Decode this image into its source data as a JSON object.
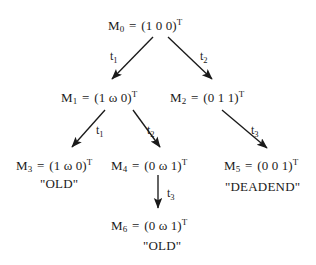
{
  "figure": {
    "type": "reachability-tree",
    "title": "",
    "background_color": "#ffffff",
    "ink_color": "#1a1a1a"
  },
  "nodes": [
    {
      "id": "M0",
      "name": "M",
      "index": "0",
      "equals": "=",
      "vector": "(1 0 0)",
      "transpose": "T",
      "tag": "",
      "x": 108,
      "y": 18
    },
    {
      "id": "M1",
      "name": "M",
      "index": "1",
      "equals": "=",
      "vector": "(1 ω 0)",
      "transpose": "T",
      "tag": "",
      "x": 61,
      "y": 90
    },
    {
      "id": "M2",
      "name": "M",
      "index": "2",
      "equals": "=",
      "vector": "(0 1 1)",
      "transpose": "T",
      "tag": "",
      "x": 170,
      "y": 90
    },
    {
      "id": "M3",
      "name": "M",
      "index": "3",
      "equals": "=",
      "vector": "(1 ω 0)",
      "transpose": "T",
      "tag": "\"OLD\"",
      "x": 16,
      "y": 158
    },
    {
      "id": "M4",
      "name": "M",
      "index": "4",
      "equals": "=",
      "vector": "(0 ω 1)",
      "transpose": "T",
      "tag": "",
      "x": 111,
      "y": 158
    },
    {
      "id": "M5",
      "name": "M",
      "index": "5",
      "equals": "=",
      "vector": "(0 0 1)",
      "transpose": "T",
      "tag": "\"DEADEND\"",
      "x": 224,
      "y": 158
    },
    {
      "id": "M6",
      "name": "M",
      "index": "6",
      "equals": "=",
      "vector": "(0 ω 1)",
      "transpose": "T",
      "tag": "\"OLD\"",
      "x": 111,
      "y": 218
    }
  ],
  "node_tags": [
    {
      "for": "M3",
      "text": "\"OLD\"",
      "x": 40,
      "y": 177
    },
    {
      "for": "M5",
      "text": "\"DEADEND\"",
      "x": 225,
      "y": 180
    },
    {
      "for": "M6",
      "text": "\"OLD\"",
      "x": 143,
      "y": 239
    }
  ],
  "edges": [
    {
      "id": "e1",
      "from": "M0",
      "to": "M1",
      "label": "t",
      "label_index": "1",
      "label_x": 110,
      "label_y": 50,
      "x1": 153,
      "y1": 37,
      "x2": 112,
      "y2": 79
    },
    {
      "id": "e2",
      "from": "M0",
      "to": "M2",
      "label": "t",
      "label_index": "2",
      "label_x": 200,
      "label_y": 50,
      "x1": 168,
      "y1": 37,
      "x2": 212,
      "y2": 79
    },
    {
      "id": "e3",
      "from": "M1",
      "to": "M3",
      "label": "t",
      "label_index": "1",
      "label_x": 96,
      "label_y": 124,
      "x1": 105,
      "y1": 110,
      "x2": 72,
      "y2": 147
    },
    {
      "id": "e4",
      "from": "M1",
      "to": "M4",
      "label": "t",
      "label_index": "2",
      "label_x": 147,
      "label_y": 124,
      "x1": 133,
      "y1": 110,
      "x2": 160,
      "y2": 147
    },
    {
      "id": "e5",
      "from": "M2",
      "to": "M5",
      "label": "t",
      "label_index": "3",
      "label_x": 251,
      "label_y": 124,
      "x1": 222,
      "y1": 110,
      "x2": 267,
      "y2": 148
    },
    {
      "id": "e6",
      "from": "M4",
      "to": "M6",
      "label": "t",
      "label_index": "3",
      "label_x": 167,
      "label_y": 187,
      "x1": 158,
      "y1": 175,
      "x2": 158,
      "y2": 208
    }
  ]
}
